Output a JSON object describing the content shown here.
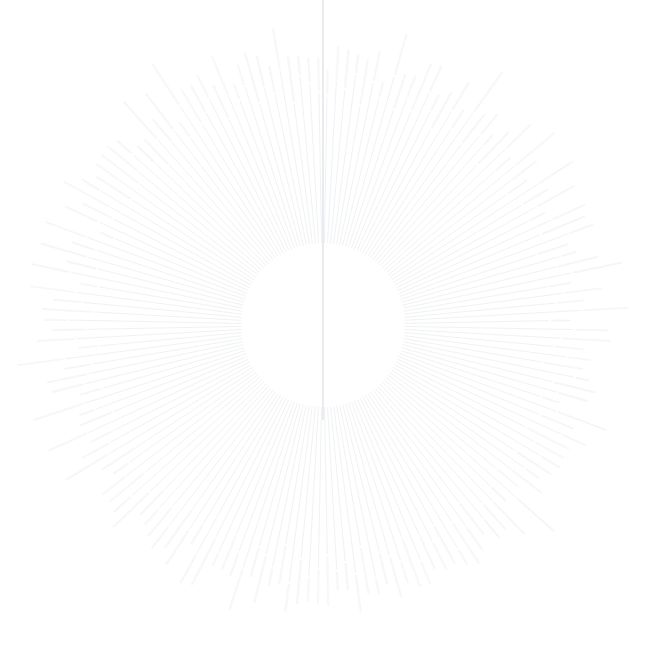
{
  "figure": {
    "kind": "radial-dendrogram",
    "title": "",
    "background_color": "#ffffff",
    "width": 658,
    "height": 651
  },
  "chart_data": {
    "type": "tree",
    "layout": "radial",
    "title": "",
    "subtitle": "",
    "xlabel": "",
    "ylabel": "",
    "legend": [],
    "annotations": [],
    "grid": false,
    "axes_visible": false,
    "center": {
      "x": 323,
      "y": 325
    },
    "inner_radius": 82,
    "outer_radius": 292,
    "root_angle_deg": -90,
    "root_stem": {
      "present": true,
      "from_y": 0,
      "to_y": 420,
      "x": 323,
      "color": "#e4e7ea",
      "width": 1.6
    },
    "angle_gap_deg": 2.0,
    "leaf_count": 168,
    "label_color": "#ebedef",
    "label_font_size": 3.2,
    "branch_color": "#eceff1",
    "branch_width": 0.85,
    "label_placeholder_text": "aaaaaaaaaaaaaaaaaaaa",
    "leaf_label_lengths": [
      14,
      19,
      22,
      11,
      26,
      17,
      9,
      24,
      20,
      13,
      28,
      16,
      10,
      23,
      18,
      12,
      27,
      21,
      15,
      8,
      25,
      19,
      11,
      29,
      17,
      13,
      22,
      16,
      24,
      10,
      20,
      26,
      14,
      18,
      9,
      23,
      28,
      12,
      21,
      15,
      25,
      11,
      19,
      27,
      16,
      13,
      22,
      8,
      24,
      17,
      10,
      29,
      20,
      14,
      26,
      18,
      12,
      23,
      9,
      21,
      15,
      28,
      11,
      25,
      19,
      13,
      22,
      16,
      27,
      10,
      24,
      17,
      20,
      14,
      29,
      12,
      23,
      18,
      9,
      26,
      21,
      15,
      11,
      28,
      19,
      13,
      25,
      16,
      22,
      10,
      27,
      17,
      24,
      14,
      20,
      8,
      29,
      18,
      12,
      23,
      26,
      15,
      21,
      11,
      19,
      28,
      13,
      25,
      16,
      10,
      22,
      27,
      17,
      14,
      24,
      20,
      9,
      29,
      12,
      18,
      23,
      15,
      26,
      11,
      21,
      19,
      13,
      28,
      16,
      25,
      10,
      22,
      17,
      27,
      14,
      24,
      8,
      20,
      18,
      29,
      12,
      23,
      15,
      26,
      21,
      11,
      13,
      19,
      28,
      16,
      25,
      10,
      27,
      22,
      17,
      14,
      20,
      24,
      9,
      12,
      29,
      18,
      15,
      23,
      26,
      11
    ],
    "leaf_radii": [
      228,
      244,
      236,
      252,
      221,
      247,
      233,
      258,
      226,
      241,
      231,
      255,
      238,
      223,
      249,
      234,
      260,
      227,
      245,
      239,
      222,
      253,
      230,
      248,
      237,
      225,
      257,
      232,
      243,
      229,
      251,
      235,
      261,
      224,
      246,
      240,
      254,
      228,
      242,
      233,
      259,
      226,
      250,
      238,
      231,
      245,
      222,
      256,
      236,
      243,
      229,
      249,
      234,
      262,
      227,
      241,
      253,
      230,
      247,
      237,
      225,
      258,
      232,
      244,
      239,
      251,
      223,
      246,
      235,
      260,
      228,
      242,
      231,
      254,
      226,
      248,
      240,
      233,
      257,
      224,
      250,
      237,
      245,
      229,
      243,
      252,
      234,
      259,
      222,
      247,
      236,
      230,
      255,
      241,
      227,
      249,
      238,
      261,
      232,
      244,
      225,
      253,
      235,
      246,
      228,
      240,
      256,
      231,
      248,
      237,
      223,
      250,
      243,
      233,
      258,
      226,
      242,
      251,
      229,
      245,
      239,
      234,
      260,
      224,
      247,
      236,
      254,
      230,
      241,
      249,
      227,
      257,
      232,
      244,
      238,
      252,
      225,
      246,
      235,
      243,
      259,
      228,
      250,
      231,
      240,
      255,
      233,
      222,
      248,
      237,
      245,
      229,
      262,
      234,
      242,
      253,
      226,
      247,
      239,
      251,
      230,
      244,
      236,
      258,
      223,
      249,
      241,
      232
    ]
  }
}
